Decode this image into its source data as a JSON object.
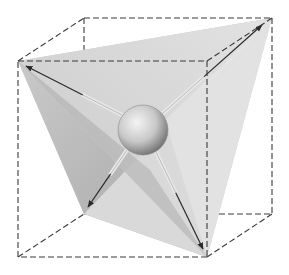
{
  "diagram": {
    "type": "tetrahedron-in-cube",
    "colors": {
      "background": "#ffffff",
      "cube_edge": "#3a3a3a",
      "face_light": "#d9d9d9",
      "face_mid": "#c4c4c4",
      "face_dark": "#a9a9a9",
      "face_top": "#cfcfcf",
      "arrow": "#2a2a2a",
      "rod": "#e8e8e8",
      "sphere_highlight": "#f4f4f4",
      "sphere_shadow": "#6e6e6e"
    },
    "cube_vertices": {
      "front_top_left": [
        18,
        61
      ],
      "front_top_right": [
        207,
        61
      ],
      "front_bottom_left": [
        18,
        257
      ],
      "front_bottom_right": [
        207,
        257
      ],
      "back_top_left": [
        84,
        18
      ],
      "back_top_right": [
        272,
        18
      ],
      "back_bottom_left": [
        84,
        214
      ],
      "back_bottom_right": [
        272,
        214
      ]
    },
    "tetrahedron_vertices": {
      "v1": [
        18,
        61
      ],
      "v2": [
        272,
        18
      ],
      "v3": [
        84,
        214
      ],
      "v4": [
        207,
        257
      ]
    },
    "sphere": {
      "cx": 143,
      "cy": 130,
      "r": 25
    },
    "arrows": [
      {
        "name": "arrow-to-front-top-left",
        "from": [
          124,
          116
        ],
        "to": [
          26,
          66
        ]
      },
      {
        "name": "arrow-to-back-top-right",
        "from": [
          162,
          114
        ],
        "to": [
          262,
          25
        ]
      },
      {
        "name": "arrow-to-back-bottom-left",
        "from": [
          127,
          150
        ],
        "to": [
          88,
          207
        ]
      },
      {
        "name": "arrow-to-front-bottom-right",
        "from": [
          156,
          152
        ],
        "to": [
          203,
          249
        ]
      }
    ]
  }
}
